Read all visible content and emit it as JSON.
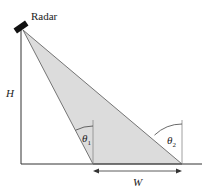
{
  "diagram": {
    "radar_label": "Radar",
    "height_label": "H",
    "width_label": "W",
    "angle1_label": "θ",
    "angle1_sub": "1",
    "angle2_label": "θ",
    "angle2_sub": "2",
    "colors": {
      "beam_fill": "#dcdcdc",
      "lines": "#333333",
      "radar": "#111111"
    }
  }
}
